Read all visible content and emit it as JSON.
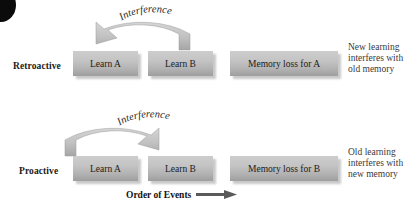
{
  "diagram": {
    "arrow_label": "Interference",
    "footer_label": "Order of Events",
    "colors": {
      "box_top": "#cdcdcd",
      "box_bottom": "#9e9e9e",
      "arrow": "#b8b8b8",
      "text": "#1b1b1b",
      "explain_text": "#3a3a3a",
      "footer_arrow": "#5a5a5a"
    },
    "rows": [
      {
        "label": "Retroactive",
        "boxes": [
          {
            "text": "Learn A"
          },
          {
            "text": "Learn B"
          },
          {
            "text": "Memory loss for A"
          }
        ],
        "arrow_label": "Interference",
        "arrow_direction": "right-to-left",
        "explanation": [
          "New learning",
          "interferes with",
          "old memory"
        ]
      },
      {
        "label": "Proactive",
        "boxes": [
          {
            "text": "Learn A"
          },
          {
            "text": "Learn B"
          },
          {
            "text": "Memory loss for B"
          }
        ],
        "arrow_label": "Interference",
        "arrow_direction": "left-to-right",
        "explanation": [
          "Old learning",
          "interferes with",
          "new memory"
        ]
      }
    ]
  }
}
